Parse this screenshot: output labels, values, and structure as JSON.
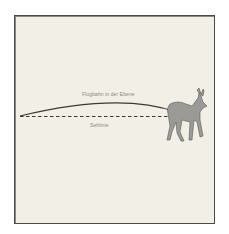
{
  "diagram": {
    "arc_label": "Flugbahn in der Ebene",
    "line_label": "Sehlinie",
    "colors": {
      "background": "#f1efe6",
      "frame": "#4a4a46",
      "lines": "#3a3a36",
      "deer_fill": "#9a9a96",
      "deer_outline": "#5a5a56",
      "text": "#8a8a84"
    }
  }
}
